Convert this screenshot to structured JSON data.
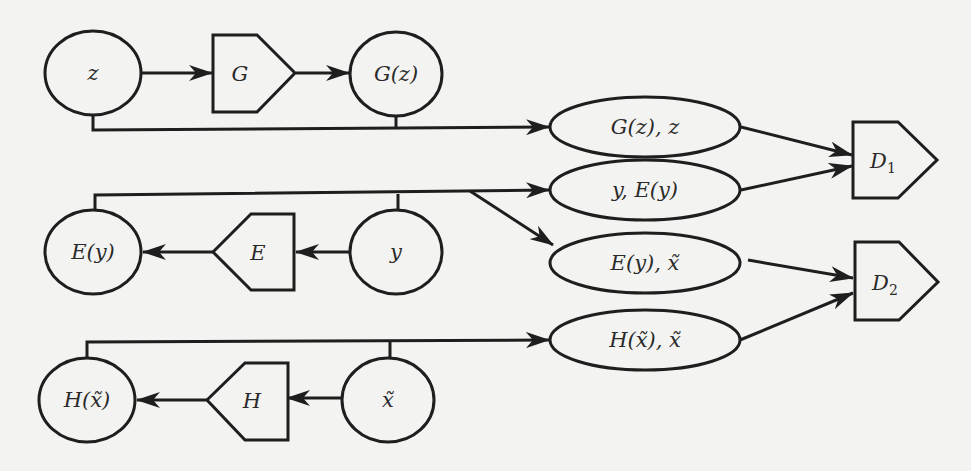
{
  "diagram": {
    "type": "architecture-flow",
    "background": "#f3f3f1",
    "stroke_color": "#1e1e1e",
    "nodes": {
      "z": {
        "label": "z",
        "shape": "ellipse"
      },
      "G": {
        "label": "G",
        "shape": "pentagon-right"
      },
      "Gz": {
        "label": "G(z)",
        "shape": "ellipse"
      },
      "Gz_z": {
        "label": "G(z), z",
        "shape": "ellipse"
      },
      "y_Ey": {
        "label": "y, E(y)",
        "shape": "ellipse"
      },
      "Ey_xt": {
        "label": "E(y), x̃",
        "shape": "ellipse"
      },
      "Hxt_xt": {
        "label": "H(x̃), x̃",
        "shape": "ellipse"
      },
      "D1": {
        "label": "D",
        "sub": "1",
        "shape": "pentagon-right"
      },
      "D2": {
        "label": "D",
        "sub": "2",
        "shape": "pentagon-right"
      },
      "Ey": {
        "label": "E(y)",
        "shape": "ellipse"
      },
      "E": {
        "label": "E",
        "shape": "pentagon-left"
      },
      "y": {
        "label": "y",
        "shape": "ellipse"
      },
      "Hxt": {
        "label": "H(x̃)",
        "shape": "ellipse"
      },
      "H": {
        "label": "H",
        "shape": "pentagon-left"
      },
      "xt": {
        "label": "x̃",
        "shape": "ellipse"
      }
    },
    "edges": [
      {
        "from": "z",
        "to": "G"
      },
      {
        "from": "G",
        "to": "Gz"
      },
      {
        "from": [
          "z",
          "Gz"
        ],
        "to": "Gz_z"
      },
      {
        "from": "Gz_z",
        "to": "D1"
      },
      {
        "from": "y_Ey",
        "to": "D1"
      },
      {
        "from": [
          "Ey",
          "y"
        ],
        "to": "y_Ey"
      },
      {
        "from": "y",
        "to": "Ey_xt"
      },
      {
        "from": "y",
        "to": "E"
      },
      {
        "from": "E",
        "to": "Ey"
      },
      {
        "from": "Ey_xt",
        "to": "D2"
      },
      {
        "from": "Hxt_xt",
        "to": "D2"
      },
      {
        "from": [
          "Hxt",
          "xt"
        ],
        "to": "Hxt_xt"
      },
      {
        "from": "xt",
        "to": "H"
      },
      {
        "from": "H",
        "to": "Hxt"
      }
    ]
  }
}
